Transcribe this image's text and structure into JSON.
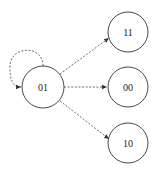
{
  "diagram": {
    "type": "state-transition",
    "nodes": [
      {
        "id": "n01",
        "label": "01",
        "cx": 43,
        "cy": 87,
        "r": 21
      },
      {
        "id": "n11",
        "label": "11",
        "cx": 128,
        "cy": 32,
        "r": 20
      },
      {
        "id": "n00",
        "label": "00",
        "cx": 128,
        "cy": 87,
        "r": 20
      },
      {
        "id": "n10",
        "label": "10",
        "cx": 128,
        "cy": 143,
        "r": 20
      }
    ],
    "edges": [
      {
        "from": "01",
        "to": "01",
        "style": "dashed",
        "kind": "self-loop"
      },
      {
        "from": "01",
        "to": "11",
        "style": "dashed"
      },
      {
        "from": "01",
        "to": "00",
        "style": "dashed"
      },
      {
        "from": "01",
        "to": "10",
        "style": "dashed"
      }
    ],
    "colors": {
      "stroke": "#333333",
      "edge": "#444444",
      "background": "#ffffff"
    }
  }
}
